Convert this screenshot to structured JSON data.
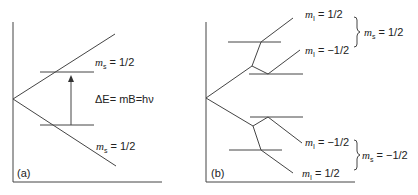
{
  "figure": {
    "panel_a": {
      "label": "(a)",
      "upper_level": {
        "var": "m",
        "sub": "s",
        "value": "= 1/2"
      },
      "lower_level": {
        "var": "m",
        "sub": "s",
        "value": "= 1/2"
      },
      "transition": {
        "text": "ΔE= mB=hν"
      }
    },
    "panel_b": {
      "label": "(b)",
      "levels": [
        {
          "var": "m",
          "sub": "I",
          "value": "= 1/2"
        },
        {
          "var": "m",
          "sub": "I",
          "value": "= −1/2"
        },
        {
          "var": "m",
          "sub": "I",
          "value": "= −1/2"
        },
        {
          "var": "m",
          "sub": "I",
          "value": "= 1/2"
        }
      ],
      "groups": [
        {
          "var": "m",
          "sub": "s",
          "value": "= 1/2"
        },
        {
          "var": "m",
          "sub": "s",
          "value": "= −1/2"
        }
      ]
    },
    "colors": {
      "line": "#444444",
      "text": "#222222"
    }
  }
}
